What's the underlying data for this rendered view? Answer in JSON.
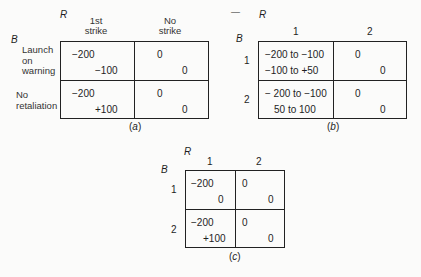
{
  "panels": [
    {
      "id": "a",
      "caption": "(a)",
      "col_player": "R",
      "row_player": "B",
      "columns": [
        "1st strike",
        "No strike"
      ],
      "column_lines": [
        [
          "1st",
          "strike"
        ],
        [
          "No",
          "strike"
        ]
      ],
      "rows": [
        "Launch on warning",
        "No retaliation"
      ],
      "row_lines": [
        [
          "Launch",
          "on",
          "warning"
        ],
        [
          "No",
          "retaliation"
        ]
      ],
      "cells": [
        [
          {
            "b": "−200",
            "r": "−100"
          },
          {
            "b": "0",
            "r": "0"
          }
        ],
        [
          {
            "b": "−200",
            "r": "+100"
          },
          {
            "b": "0",
            "r": "0"
          }
        ]
      ]
    },
    {
      "id": "b",
      "caption": "(b)",
      "col_player": "R",
      "row_player": "B",
      "arrow_mark": "—",
      "columns": [
        "1",
        "2"
      ],
      "rows": [
        "1",
        "2"
      ],
      "cells": [
        [
          {
            "b": "−200 to −100",
            "r": "−100 to +50"
          },
          {
            "b": "0",
            "r": "0"
          }
        ],
        [
          {
            "b": "− 200 to −100",
            "r": "50 to 100"
          },
          {
            "b": "0",
            "r": "0"
          }
        ]
      ]
    },
    {
      "id": "c",
      "caption": "(c)",
      "col_player": "R",
      "row_player": "B",
      "columns": [
        "1",
        "2"
      ],
      "rows": [
        "1",
        "2"
      ],
      "cells": [
        [
          {
            "b": "−200",
            "r": "0"
          },
          {
            "b": "0",
            "r": "0"
          }
        ],
        [
          {
            "b": "−200",
            "r": "+100"
          },
          {
            "b": "0",
            "r": "0"
          }
        ]
      ]
    }
  ]
}
